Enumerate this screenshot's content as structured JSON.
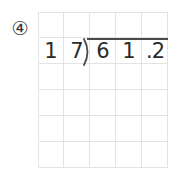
{
  "page": {
    "background_color": "#ffffff",
    "grid_line_color": "#e3e3e3",
    "ink_color": "#2b2b2b"
  },
  "problem": {
    "number_label": "④",
    "number_plain": "4",
    "type": "long-division",
    "expression": "61.2 ÷ 17",
    "divisor": "17",
    "dividend": "61.2",
    "quotient_entered": "",
    "bracket_symbol": ")",
    "overbar": true
  },
  "grid": {
    "columns": 5,
    "rows": 6,
    "cell_size_px": 26,
    "cells": [
      [
        "",
        "",
        "",
        "",
        ""
      ],
      [
        "1",
        "7",
        "6",
        "1",
        ".2"
      ],
      [
        "",
        "",
        "",
        "",
        ""
      ],
      [
        "",
        "",
        "",
        "",
        ""
      ],
      [
        "",
        "",
        "",
        "",
        ""
      ],
      [
        "",
        "",
        "",
        "",
        ""
      ]
    ]
  },
  "written_marks": [
    {
      "name": "divisor-tens-digit",
      "text": "1",
      "col": 0,
      "row": 1
    },
    {
      "name": "divisor-ones-digit",
      "text": "7",
      "col": 1,
      "row": 1
    },
    {
      "name": "dividend-digit-6",
      "text": "6",
      "col": 2,
      "row": 1
    },
    {
      "name": "dividend-digit-1",
      "text": "1",
      "col": 3,
      "row": 1
    },
    {
      "name": "dividend-decimal-2",
      "text": ".2",
      "col": 4,
      "row": 1
    }
  ]
}
